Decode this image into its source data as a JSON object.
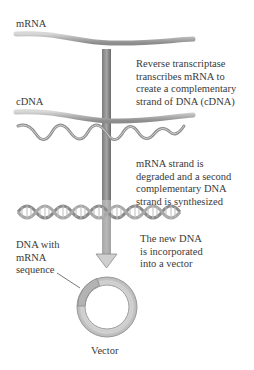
{
  "diagram": {
    "labels": {
      "mrna": "mRNA",
      "cdna": "cDNA",
      "dna_with_mrna": "DNA with\nmRNA\nsequence",
      "vector": "Vector"
    },
    "steps": [
      {
        "text": "Reverse transcriptase\ntranscribes mRNA to\ncreate a complementary\nstrand of DNA (cDNA)"
      },
      {
        "text": "mRNA strand is\ndegraded and a second\ncomplementary DNA\nstrand is synthesized"
      },
      {
        "text": "The new DNA\nis incorporated\ninto a vector"
      }
    ],
    "colors": {
      "strand": "#b5b5b5",
      "strand_dark": "#8a8a8a",
      "arrow": "#9a9a9a",
      "arrow_dark": "#6e6e6e",
      "ring": "#cfcfcf",
      "text": "#3a3a3a"
    }
  }
}
